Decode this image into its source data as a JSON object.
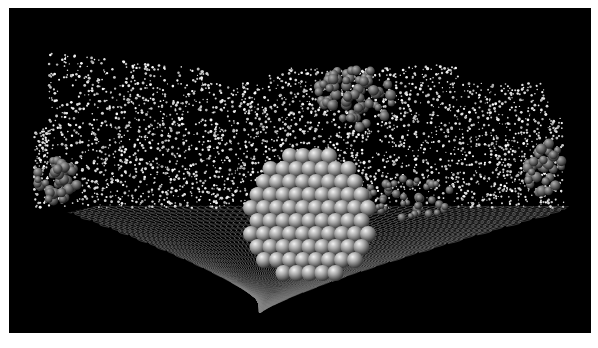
{
  "figure": {
    "background_color": "#000000",
    "frame_color": "#ffffff",
    "atom_color": "#9a9a9a",
    "solvent_color": "#e6e6e6",
    "lattice_color": "#8a8a8a"
  }
}
